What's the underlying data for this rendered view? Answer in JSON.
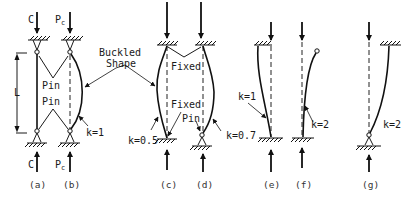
{
  "figure": {
    "type": "effective-length-factors-for-columns",
    "labels": {
      "load_top_a": "C",
      "load_top_b": "P",
      "load_top_b_sub": "c",
      "load_bottom_a": "C",
      "load_bottom_b": "P",
      "load_bottom_b_sub": "c",
      "length": "L",
      "pin_top": "Pin",
      "pin_bottom": "Pin",
      "buckled_shape_line1": "Buckled",
      "buckled_shape_line2": "Shape",
      "fixed_top": "Fixed",
      "fixed_bottom": "Fixed",
      "pin_d": "Pin"
    },
    "k_values": {
      "b": "k=1",
      "c": "k=0.5",
      "d": "k=0.7",
      "e": "k=1",
      "f": "k=2",
      "g": "k=2"
    },
    "captions": [
      "(a)",
      "(b)",
      "(c)",
      "(d)",
      "(e)",
      "(f)",
      "(g)"
    ],
    "cases": [
      {
        "id": "a",
        "top": "pin",
        "bottom": "pin",
        "shape": "straight"
      },
      {
        "id": "b",
        "top": "pin",
        "bottom": "pin",
        "shape": "single-curve",
        "k": "k=1"
      },
      {
        "id": "c",
        "top": "fixed",
        "bottom": "fixed",
        "shape": "double-curve",
        "k": "k=0.5"
      },
      {
        "id": "d",
        "top": "fixed",
        "bottom": "pin",
        "shape": "curve",
        "k": "k=0.7"
      },
      {
        "id": "e",
        "top": "fixed (sway)",
        "bottom": "fixed",
        "shape": "sway",
        "k": "k=1"
      },
      {
        "id": "f",
        "top": "free",
        "bottom": "fixed",
        "shape": "cantilever",
        "k": "k=2"
      },
      {
        "id": "g",
        "top": "fixed (sway)",
        "bottom": "pin",
        "shape": "sway",
        "k": "k=2"
      }
    ]
  }
}
